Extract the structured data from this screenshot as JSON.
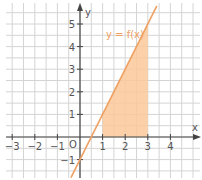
{
  "chart_data": {
    "type": "line",
    "title": "",
    "xlabel": "x",
    "ylabel": "y",
    "function_label": "y = f(x)",
    "function": "f(x) = 2x - 1",
    "series": [
      {
        "name": "y = f(x)",
        "x": [
          -0.4,
          0,
          0.5,
          1,
          2,
          3,
          3.4
        ],
        "y": [
          -1.8,
          -1,
          0,
          1,
          3,
          5,
          5.8
        ]
      }
    ],
    "shaded_region": {
      "description": "area under y = f(x) above x-axis",
      "x_from": 1,
      "x_to": 3,
      "vertices": [
        [
          1,
          0
        ],
        [
          1,
          1
        ],
        [
          3,
          5
        ],
        [
          3,
          0
        ]
      ]
    },
    "x_ticks": [
      -3,
      -2,
      -1,
      1,
      2,
      3,
      4
    ],
    "y_ticks": [
      -1,
      1,
      2,
      3,
      4,
      5
    ],
    "origin_label": "O",
    "xlim": [
      -3.2,
      5.3
    ],
    "ylim": [
      -1.8,
      6.0
    ],
    "grid": true,
    "grid_step": 0.5,
    "legend": "none"
  },
  "colors": {
    "line": "#f0a060",
    "fill": "#fbc99a",
    "grid": "#d4d4d4",
    "axis": "#444444",
    "text": "#555555"
  },
  "labels": {
    "x_axis": "x",
    "y_axis": "y",
    "origin": "O",
    "function": "y = f(x)",
    "x_ticks": [
      "−3",
      "−2",
      "−1",
      "1",
      "2",
      "3",
      "4"
    ],
    "y_ticks": [
      "−1",
      "1",
      "2",
      "3",
      "4",
      "5"
    ]
  }
}
